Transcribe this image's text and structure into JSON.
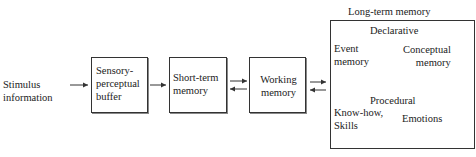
{
  "diagram": {
    "input": {
      "line1": "Stimulus",
      "line2": "information"
    },
    "sensory": {
      "line1": "Sensory-",
      "line2": "perceptual",
      "line3": "buffer"
    },
    "short_term": {
      "line1": "Short-term",
      "line2": "memory"
    },
    "working": {
      "line1": "Working",
      "line2": "memory"
    },
    "long_term": {
      "title": "Long-term memory",
      "declarative": {
        "title": "Declarative",
        "event": {
          "line1": "Event",
          "line2": "memory"
        },
        "conceptual": {
          "line1": "Conceptual",
          "line2": "memory"
        }
      },
      "procedural": {
        "title": "Procedural",
        "skills": {
          "line1": "Know-how,",
          "line2": "Skills"
        },
        "emotions": "Emotions"
      }
    }
  }
}
